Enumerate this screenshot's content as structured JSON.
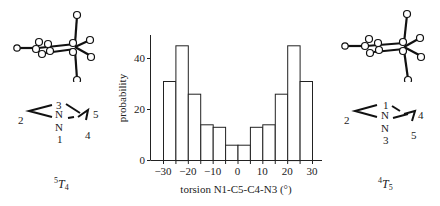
{
  "left_panel": {
    "ring_labels": {
      "top": "3",
      "left": "2",
      "n_top": "N",
      "n_bottom": "N",
      "bottom": "1",
      "right_top": "5",
      "right_bottom": "4"
    },
    "conformer": {
      "sup": "5",
      "main": "T",
      "sub": "4"
    }
  },
  "right_panel": {
    "ring_labels": {
      "top": "1",
      "left": "2",
      "n_top": "N",
      "n_bottom": "N",
      "bottom": "3",
      "right_top": "4",
      "right_bottom": "5"
    },
    "conformer": {
      "sup": "4",
      "main": "T",
      "sub": "5"
    }
  },
  "chart_data": {
    "type": "bar",
    "title": "",
    "xlabel": "torsion N1-C5-C4-N3 (°)",
    "ylabel": "probability",
    "bin_edges": [
      -30,
      -25,
      -20,
      -15,
      -10,
      -5,
      0,
      5,
      10,
      15,
      20,
      25,
      30
    ],
    "categories": [
      "-27.5",
      "-22.5",
      "-17.5",
      "-12.5",
      "-7.5",
      "-2.5",
      "2.5",
      "7.5",
      "12.5",
      "17.5",
      "22.5",
      "27.5"
    ],
    "values": [
      31,
      45,
      26,
      14,
      13,
      6,
      6,
      13,
      14,
      26,
      45,
      31
    ],
    "x_ticks": [
      "−30",
      "−20",
      "−10",
      "0",
      "10",
      "20",
      "30"
    ],
    "x_tick_values": [
      -30,
      -20,
      -10,
      0,
      10,
      20,
      30
    ],
    "y_ticks": [
      "0",
      "20",
      "40"
    ],
    "y_tick_values": [
      0,
      20,
      40
    ],
    "xlim": [
      -35,
      35
    ],
    "ylim": [
      0,
      48
    ],
    "grid": false,
    "legend": null
  }
}
